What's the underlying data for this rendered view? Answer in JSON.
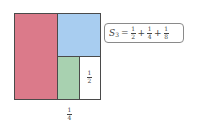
{
  "diagram": {
    "colors": {
      "red": "#db7a8a",
      "blue": "#a8cdf0",
      "green": "#a8d1b0",
      "white": "#ffffff",
      "border": "#4a4a4a"
    },
    "regions": [
      {
        "name": "half-region",
        "color": "red",
        "value": "1/2"
      },
      {
        "name": "quarter-region",
        "color": "blue",
        "value": "1/4"
      },
      {
        "name": "eighth-region",
        "color": "green",
        "value": "1/8"
      },
      {
        "name": "remaining-region",
        "color": "white",
        "value": "1/8"
      }
    ],
    "labels": {
      "inner_half": {
        "num": "1",
        "den": "2"
      },
      "bottom_quarter": {
        "num": "1",
        "den": "4"
      }
    },
    "equation": {
      "lhs_symbol": "S",
      "lhs_subscript": "3",
      "equals": "=",
      "plus": "+",
      "terms": [
        {
          "num": "1",
          "den": "2"
        },
        {
          "num": "1",
          "den": "4"
        },
        {
          "num": "1",
          "den": "8"
        }
      ]
    }
  }
}
